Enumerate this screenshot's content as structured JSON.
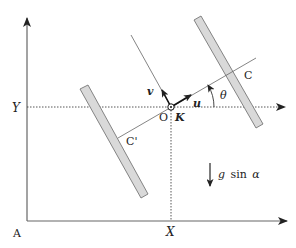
{
  "diagram": {
    "labels": {
      "origin_A": "A",
      "axis_X": "X",
      "axis_Y": "Y",
      "point_O": "O",
      "point_K": "K",
      "point_C": "C",
      "point_C_prime": "C'",
      "vector_u": "u",
      "vector_v": "v",
      "angle_theta": "θ",
      "gravity_g": "g",
      "gravity_sin": "sin",
      "gravity_alpha": "α"
    },
    "colors": {
      "line": "#555555",
      "bar_fill": "#d9d9d9",
      "bar_stroke": "#777777",
      "text": "#222222"
    }
  }
}
